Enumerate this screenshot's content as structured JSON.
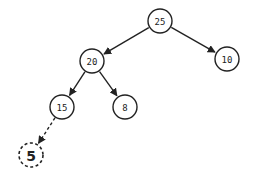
{
  "diagram": {
    "type": "binary-tree",
    "nodes": [
      {
        "id": "n25",
        "label": "25",
        "x": 160,
        "y": 21,
        "style": "solid"
      },
      {
        "id": "n20",
        "label": "20",
        "x": 92,
        "y": 61,
        "style": "solid"
      },
      {
        "id": "n10",
        "label": "10",
        "x": 227,
        "y": 59,
        "style": "solid"
      },
      {
        "id": "n15",
        "label": "15",
        "x": 62,
        "y": 107,
        "style": "solid"
      },
      {
        "id": "n8",
        "label": "8",
        "x": 125,
        "y": 107,
        "style": "solid"
      },
      {
        "id": "n5",
        "label": "5",
        "x": 31,
        "y": 155,
        "style": "dashed"
      }
    ],
    "edges": [
      {
        "from": "n25",
        "to": "n20",
        "style": "solid"
      },
      {
        "from": "n25",
        "to": "n10",
        "style": "solid"
      },
      {
        "from": "n20",
        "to": "n15",
        "style": "solid"
      },
      {
        "from": "n20",
        "to": "n8",
        "style": "solid"
      },
      {
        "from": "n15",
        "to": "n5",
        "style": "dashed"
      }
    ]
  }
}
